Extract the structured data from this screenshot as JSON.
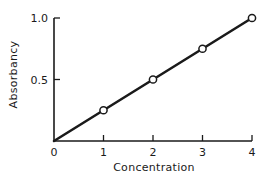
{
  "chart_data": {
    "type": "line",
    "title": "",
    "xlabel": "Concentration",
    "ylabel": "Absorbancy",
    "x": [
      0,
      1,
      2,
      3,
      4
    ],
    "series": [
      {
        "name": "Absorbancy",
        "values": [
          0,
          0.25,
          0.5,
          0.75,
          1.0
        ],
        "markers": [
          false,
          true,
          true,
          true,
          true
        ]
      }
    ],
    "xlim": [
      0,
      4
    ],
    "ylim": [
      0,
      1.0
    ],
    "x_ticks": [
      {
        "value": 0,
        "label": "0"
      },
      {
        "value": 1,
        "label": "1"
      },
      {
        "value": 2,
        "label": "2"
      },
      {
        "value": 3,
        "label": "3"
      },
      {
        "value": 4,
        "label": "4"
      }
    ],
    "y_ticks": [
      {
        "value": 0.5,
        "label": "0.5"
      },
      {
        "value": 1.0,
        "label": "1.0"
      }
    ],
    "grid": false,
    "legend": null,
    "colors": {
      "line": "#1a1a1a",
      "marker_fill": "#ffffff",
      "background": "#ffffff"
    }
  }
}
